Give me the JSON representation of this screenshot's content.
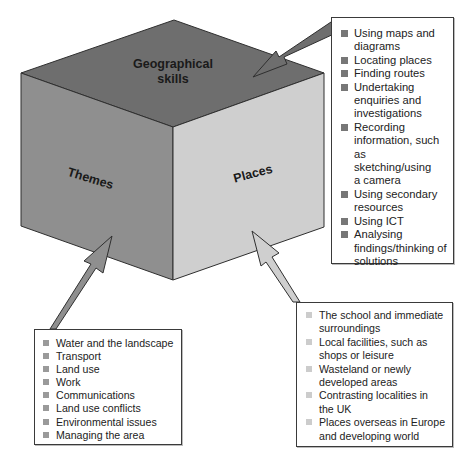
{
  "cube": {
    "top_face_label_line1": "Geographical",
    "top_face_label_line2": "skills",
    "left_face_label": "Themes",
    "right_face_label": "Places",
    "colors": {
      "top_face": "#6e6e6e",
      "left_face": "#8f8f8f",
      "right_face": "#cfcfcf",
      "edges": "#2f2f2f"
    }
  },
  "skills_box": {
    "items": [
      "Using maps and diagrams",
      "Locating places",
      "Finding routes",
      "Undertaking enquiries and investigations",
      "Recording information, such as sketching/using a camera",
      "Using secondary resources",
      "Using ICT",
      "Analysing findings/thinking of solutions"
    ],
    "lines": [
      [
        "Using maps and",
        "diagrams"
      ],
      [
        "Locating places"
      ],
      [
        "Finding routes"
      ],
      [
        "Undertaking",
        "enquiries and",
        "investigations"
      ],
      [
        "Recording",
        "information, such as",
        "sketching/using",
        "a camera"
      ],
      [
        "Using secondary",
        "resources"
      ],
      [
        "Using ICT"
      ],
      [
        "Analysing",
        "findings/thinking of",
        "solutions"
      ]
    ],
    "bullet_color": "#777777"
  },
  "themes_box": {
    "items": [
      "Water and the landscape",
      "Transport",
      "Land use",
      "Work",
      "Communications",
      "Land use conflicts",
      "Environmental issues",
      "Managing the area"
    ],
    "bullet_color": "#9a9a9a"
  },
  "places_box": {
    "items": [
      "The school and immediate surroundings",
      "Local facilities, such as shops or leisure",
      "Wasteland or newly developed areas",
      "Contrasting localities in the UK",
      "Places overseas in Europe and developing world"
    ],
    "lines": [
      [
        "The school and immediate",
        "surroundings"
      ],
      [
        "Local facilities, such as",
        "shops or leisure"
      ],
      [
        "Wasteland or newly",
        "developed areas"
      ],
      [
        "Contrasting localities in",
        "the UK"
      ],
      [
        "Places overseas in Europe",
        "and developing world"
      ]
    ],
    "bullet_color": "#cccccc"
  },
  "arrows": {
    "skills_arrow_color": "#6e6e6e",
    "themes_arrow_color": "#8f8f8f",
    "places_arrow_color": "#cfcfcf"
  }
}
